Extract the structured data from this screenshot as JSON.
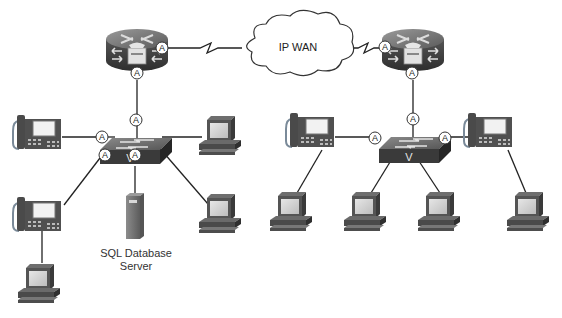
{
  "diagram": {
    "title": "",
    "cloud": {
      "label": "IP WAN"
    },
    "server": {
      "label_line1": "SQL Database",
      "label_line2": "Server"
    },
    "badge_letter": "A",
    "switch_letter": "V",
    "nodes": [
      {
        "id": "router-left",
        "type": "voice-router"
      },
      {
        "id": "router-right",
        "type": "voice-router"
      },
      {
        "id": "switch-left",
        "type": "voice-switch"
      },
      {
        "id": "switch-right",
        "type": "voice-switch"
      },
      {
        "id": "ip-wan",
        "type": "cloud"
      },
      {
        "id": "sql-server",
        "type": "server"
      },
      {
        "id": "phone-left-1",
        "type": "ip-phone"
      },
      {
        "id": "phone-left-2",
        "type": "ip-phone"
      },
      {
        "id": "phone-right-1",
        "type": "ip-phone"
      },
      {
        "id": "phone-right-2",
        "type": "ip-phone"
      },
      {
        "id": "pc-left-1",
        "type": "pc"
      },
      {
        "id": "pc-left-2",
        "type": "pc"
      },
      {
        "id": "pc-left-3",
        "type": "pc"
      },
      {
        "id": "pc-right-1",
        "type": "pc"
      },
      {
        "id": "pc-right-2",
        "type": "pc"
      },
      {
        "id": "pc-right-3",
        "type": "pc"
      },
      {
        "id": "pc-right-4",
        "type": "pc"
      }
    ],
    "edges": [
      {
        "from": "router-left",
        "to": "ip-wan",
        "type": "serial-wan"
      },
      {
        "from": "ip-wan",
        "to": "router-right",
        "type": "serial-wan"
      },
      {
        "from": "router-left",
        "to": "switch-left"
      },
      {
        "from": "router-right",
        "to": "switch-right"
      },
      {
        "from": "switch-left",
        "to": "phone-left-1"
      },
      {
        "from": "switch-left",
        "to": "phone-left-2"
      },
      {
        "from": "switch-left",
        "to": "sql-server"
      },
      {
        "from": "switch-left",
        "to": "pc-left-1"
      },
      {
        "from": "switch-left",
        "to": "pc-left-2"
      },
      {
        "from": "phone-left-2",
        "to": "pc-left-3"
      },
      {
        "from": "switch-right",
        "to": "phone-right-1"
      },
      {
        "from": "switch-right",
        "to": "phone-right-2"
      },
      {
        "from": "switch-right",
        "to": "pc-right-2"
      },
      {
        "from": "switch-right",
        "to": "pc-right-3"
      },
      {
        "from": "phone-right-1",
        "to": "pc-right-1"
      },
      {
        "from": "phone-right-2",
        "to": "pc-right-4"
      }
    ]
  }
}
